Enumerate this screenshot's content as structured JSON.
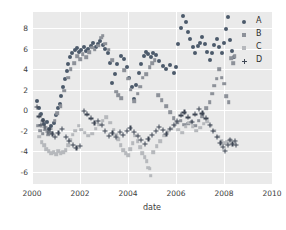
{
  "chart_data": {
    "type": "scatter",
    "title": "",
    "xlabel": "date",
    "ylabel": "",
    "xlim": [
      2000,
      2010
    ],
    "ylim": [
      -7.2,
      9.6
    ],
    "xticks": [
      2000,
      2002,
      2004,
      2006,
      2008,
      2010
    ],
    "yticks": [
      8,
      6,
      4,
      2,
      0,
      -2,
      -4,
      -6
    ],
    "grid": true,
    "legend_position": "upper right",
    "background": "#eaeaea",
    "gridline_color": "#ffffff",
    "series": [
      {
        "name": "A",
        "marker": "circle",
        "color": "#4c5a6b",
        "points": [
          [
            2000.22,
            0.9
          ],
          [
            2000.3,
            0.2
          ],
          [
            2000.38,
            -0.4
          ],
          [
            2000.45,
            -0.9
          ],
          [
            2000.52,
            -1.3
          ],
          [
            2000.62,
            -1.1
          ],
          [
            2000.72,
            -1.8
          ],
          [
            2000.8,
            -1.5
          ],
          [
            2000.9,
            -1.2
          ],
          [
            2001.0,
            -0.5
          ],
          [
            2001.08,
            0.2
          ],
          [
            2001.15,
            0.6
          ],
          [
            2001.22,
            1.4
          ],
          [
            2001.3,
            2.3
          ],
          [
            2001.38,
            3.1
          ],
          [
            2001.45,
            3.8
          ],
          [
            2001.52,
            4.5
          ],
          [
            2001.6,
            5.2
          ],
          [
            2001.68,
            5.6
          ],
          [
            2001.78,
            5.9
          ],
          [
            2001.88,
            6.1
          ],
          [
            2001.96,
            5.7
          ],
          [
            2002.05,
            5.9
          ],
          [
            2002.15,
            6.2
          ],
          [
            2002.25,
            5.8
          ],
          [
            2002.35,
            6.0
          ],
          [
            2002.45,
            6.3
          ],
          [
            2002.55,
            6.6
          ],
          [
            2002.65,
            6.2
          ],
          [
            2002.75,
            6.5
          ],
          [
            2002.85,
            6.8
          ],
          [
            2002.95,
            6.4
          ],
          [
            2003.05,
            6.0
          ],
          [
            2003.15,
            5.6
          ],
          [
            2003.25,
            4.6
          ],
          [
            2003.35,
            2.7
          ],
          [
            2003.45,
            3.5
          ],
          [
            2003.55,
            4.5
          ],
          [
            2003.7,
            5.3
          ],
          [
            2003.85,
            5.0
          ],
          [
            2003.95,
            4.2
          ],
          [
            2004.05,
            3.2
          ],
          [
            2004.15,
            2.3
          ],
          [
            2004.25,
            1.1
          ],
          [
            2004.35,
            2.5
          ],
          [
            2004.45,
            3.6
          ],
          [
            2004.55,
            4.5
          ],
          [
            2004.65,
            5.3
          ],
          [
            2004.75,
            5.7
          ],
          [
            2004.85,
            5.5
          ],
          [
            2004.95,
            5.2
          ],
          [
            2005.05,
            5.6
          ],
          [
            2005.15,
            5.4
          ],
          [
            2005.3,
            4.8
          ],
          [
            2005.45,
            4.3
          ],
          [
            2005.6,
            4.0
          ],
          [
            2005.75,
            4.4
          ],
          [
            2005.9,
            3.6
          ],
          [
            2006.0,
            4.2
          ],
          [
            2006.1,
            6.5
          ],
          [
            2006.2,
            8.0
          ],
          [
            2006.3,
            9.2
          ],
          [
            2006.4,
            8.6
          ],
          [
            2006.5,
            7.6
          ],
          [
            2006.6,
            7.0
          ],
          [
            2006.7,
            6.2
          ],
          [
            2006.8,
            5.6
          ],
          [
            2006.9,
            6.3
          ],
          [
            2007.0,
            6.6
          ],
          [
            2007.1,
            7.2
          ],
          [
            2007.2,
            6.5
          ],
          [
            2007.3,
            5.7
          ],
          [
            2007.4,
            4.9
          ],
          [
            2007.5,
            5.6
          ],
          [
            2007.6,
            6.4
          ],
          [
            2007.7,
            7.0
          ],
          [
            2007.8,
            6.2
          ],
          [
            2007.9,
            5.6
          ],
          [
            2008.0,
            6.6
          ],
          [
            2008.08,
            7.9
          ],
          [
            2008.16,
            9.1
          ],
          [
            2008.24,
            6.9
          ],
          [
            2008.32,
            5.8
          ],
          [
            2008.4,
            5.2
          ]
        ]
      },
      {
        "name": "B",
        "marker": "square",
        "color": "#8d9199",
        "points": [
          [
            2000.25,
            -1.5
          ],
          [
            2000.35,
            -2.0
          ],
          [
            2000.45,
            -2.3
          ],
          [
            2000.55,
            -1.9
          ],
          [
            2000.68,
            -2.4
          ],
          [
            2000.8,
            -2.2
          ],
          [
            2000.95,
            -1.0
          ],
          [
            2001.05,
            -0.3
          ],
          [
            2001.2,
            0.4
          ],
          [
            2001.35,
            1.9
          ],
          [
            2001.5,
            3.2
          ],
          [
            2001.62,
            4.0
          ],
          [
            2001.75,
            4.6
          ],
          [
            2001.88,
            5.3
          ],
          [
            2002.0,
            5.0
          ],
          [
            2002.12,
            5.5
          ],
          [
            2002.25,
            5.2
          ],
          [
            2002.38,
            5.7
          ],
          [
            2002.5,
            6.1
          ],
          [
            2002.62,
            5.9
          ],
          [
            2002.75,
            6.3
          ],
          [
            2002.88,
            7.1
          ],
          [
            2002.95,
            7.3
          ],
          [
            2003.05,
            6.5
          ],
          [
            2003.2,
            5.9
          ],
          [
            2003.35,
            4.9
          ],
          [
            2003.5,
            1.8
          ],
          [
            2003.6,
            1.5
          ],
          [
            2003.72,
            1.2
          ],
          [
            2003.85,
            3.9
          ],
          [
            2004.0,
            3.1
          ],
          [
            2004.12,
            2.0
          ],
          [
            2004.25,
            0.9
          ],
          [
            2004.4,
            1.6
          ],
          [
            2004.5,
            2.3
          ],
          [
            2004.62,
            3.2
          ],
          [
            2004.75,
            3.5
          ],
          [
            2004.9,
            4.2
          ],
          [
            2005.0,
            4.6
          ],
          [
            2005.12,
            4.9
          ],
          [
            2005.25,
            1.5
          ],
          [
            2005.4,
            1.0
          ],
          [
            2005.6,
            0.4
          ],
          [
            2005.75,
            -0.2
          ],
          [
            2005.9,
            -0.8
          ],
          [
            2006.05,
            -1.2
          ],
          [
            2006.2,
            -1.0
          ],
          [
            2006.35,
            -1.4
          ],
          [
            2006.5,
            -1.3
          ],
          [
            2006.65,
            -1.1
          ],
          [
            2006.8,
            -1.5
          ],
          [
            2006.95,
            -1.0
          ],
          [
            2007.1,
            -0.6
          ],
          [
            2007.25,
            0.2
          ],
          [
            2007.4,
            0.8
          ],
          [
            2007.5,
            1.6
          ],
          [
            2007.6,
            2.4
          ],
          [
            2007.7,
            3.1
          ],
          [
            2007.8,
            4.0
          ],
          [
            2007.9,
            3.2
          ],
          [
            2008.0,
            2.6
          ],
          [
            2008.1,
            1.4
          ],
          [
            2008.2,
            0.8
          ],
          [
            2008.3,
            5.1
          ],
          [
            2008.38,
            4.6
          ],
          [
            2008.45,
            5.3
          ]
        ]
      },
      {
        "name": "C",
        "marker": "square-light",
        "color": "#b6b8bc",
        "points": [
          [
            2000.3,
            -2.6
          ],
          [
            2000.4,
            -3.1
          ],
          [
            2000.5,
            -3.4
          ],
          [
            2000.6,
            -3.8
          ],
          [
            2000.7,
            -4.0
          ],
          [
            2000.8,
            -4.2
          ],
          [
            2000.9,
            -4.1
          ],
          [
            2001.0,
            -4.3
          ],
          [
            2001.1,
            -4.0
          ],
          [
            2001.2,
            -4.2
          ],
          [
            2001.3,
            -4.1
          ],
          [
            2001.4,
            -3.9
          ],
          [
            2001.5,
            -3.4
          ],
          [
            2001.6,
            -2.9
          ],
          [
            2001.7,
            -2.4
          ],
          [
            2001.8,
            -2.0
          ],
          [
            2001.95,
            -1.5
          ],
          [
            2002.05,
            -1.9
          ],
          [
            2002.2,
            -2.2
          ],
          [
            2002.35,
            -2.5
          ],
          [
            2002.5,
            -2.3
          ],
          [
            2002.65,
            -1.8
          ],
          [
            2002.8,
            -1.4
          ],
          [
            2002.95,
            -1.0
          ],
          [
            2003.1,
            -0.7
          ],
          [
            2003.25,
            -1.2
          ],
          [
            2003.4,
            -1.9
          ],
          [
            2003.5,
            -2.4
          ],
          [
            2003.6,
            -2.8
          ],
          [
            2003.7,
            -3.4
          ],
          [
            2003.8,
            -3.9
          ],
          [
            2003.9,
            -4.2
          ],
          [
            2004.0,
            -4.4
          ],
          [
            2004.1,
            -3.8
          ],
          [
            2004.2,
            -3.2
          ],
          [
            2004.3,
            -2.5
          ],
          [
            2004.4,
            -3.0
          ],
          [
            2004.5,
            -3.6
          ],
          [
            2004.6,
            -4.2
          ],
          [
            2004.7,
            -4.6
          ],
          [
            2004.78,
            -5.0
          ],
          [
            2004.85,
            -5.6
          ],
          [
            2004.9,
            -5.7
          ],
          [
            2004.95,
            -6.4
          ],
          [
            2005.05,
            -4.1
          ],
          [
            2005.2,
            -3.5
          ],
          [
            2005.35,
            -3.0
          ],
          [
            2005.5,
            -2.5
          ],
          [
            2005.65,
            -2.1
          ],
          [
            2005.8,
            -1.8
          ],
          [
            2005.95,
            -1.5
          ],
          [
            2006.1,
            -1.9
          ],
          [
            2006.25,
            -2.2
          ],
          [
            2006.4,
            -1.6
          ],
          [
            2006.55,
            -1.2
          ],
          [
            2006.7,
            -1.6
          ],
          [
            2006.85,
            -2.0
          ],
          [
            2007.0,
            -1.7
          ],
          [
            2007.15,
            -1.3
          ],
          [
            2007.3,
            -1.1
          ],
          [
            2007.45,
            -1.5
          ],
          [
            2007.6,
            -2.0
          ],
          [
            2007.75,
            -2.6
          ],
          [
            2007.9,
            -3.0
          ],
          [
            2008.0,
            -3.2
          ],
          [
            2008.12,
            -3.1
          ],
          [
            2008.25,
            -2.9
          ]
        ]
      },
      {
        "name": "D",
        "marker": "plus",
        "color": "#3f4754",
        "points": [
          [
            2000.2,
            0.3
          ],
          [
            2000.28,
            -0.6
          ],
          [
            2000.36,
            -1.4
          ],
          [
            2000.44,
            -1.0
          ],
          [
            2000.55,
            -1.6
          ],
          [
            2000.65,
            -2.1
          ],
          [
            2000.75,
            -1.8
          ],
          [
            2000.85,
            -2.3
          ],
          [
            2000.95,
            -2.6
          ],
          [
            2001.1,
            -2.2
          ],
          [
            2001.25,
            -1.8
          ],
          [
            2001.4,
            -2.6
          ],
          [
            2001.55,
            -3.0
          ],
          [
            2001.7,
            -3.4
          ],
          [
            2001.85,
            -3.7
          ],
          [
            2002.0,
            -3.5
          ],
          [
            2002.15,
            -0.1
          ],
          [
            2002.3,
            -0.4
          ],
          [
            2002.45,
            -0.8
          ],
          [
            2002.6,
            -1.2
          ],
          [
            2002.75,
            -1.0
          ],
          [
            2002.9,
            -1.4
          ],
          [
            2003.05,
            -2.0
          ],
          [
            2003.2,
            -2.5
          ],
          [
            2003.35,
            -2.2
          ],
          [
            2003.5,
            -2.6
          ],
          [
            2003.65,
            -2.1
          ],
          [
            2003.8,
            -2.4
          ],
          [
            2003.95,
            -2.0
          ],
          [
            2004.1,
            -1.7
          ],
          [
            2004.25,
            -2.1
          ],
          [
            2004.4,
            -2.5
          ],
          [
            2004.55,
            -2.9
          ],
          [
            2004.7,
            -3.3
          ],
          [
            2004.85,
            -2.8
          ],
          [
            2005.0,
            -2.4
          ],
          [
            2005.15,
            -2.0
          ],
          [
            2005.3,
            -1.6
          ],
          [
            2005.45,
            -1.9
          ],
          [
            2005.6,
            -2.3
          ],
          [
            2005.75,
            -1.8
          ],
          [
            2005.9,
            -1.4
          ],
          [
            2006.05,
            -1.0
          ],
          [
            2006.2,
            -0.5
          ],
          [
            2006.35,
            -0.2
          ],
          [
            2006.5,
            -0.7
          ],
          [
            2006.65,
            -1.1
          ],
          [
            2006.8,
            -0.4
          ],
          [
            2006.95,
            0.1
          ],
          [
            2007.1,
            -0.3
          ],
          [
            2007.25,
            -0.8
          ],
          [
            2007.4,
            -1.4
          ],
          [
            2007.55,
            -2.0
          ],
          [
            2007.7,
            -2.6
          ],
          [
            2007.85,
            -3.2
          ],
          [
            2007.95,
            -3.6
          ],
          [
            2008.05,
            -4.0
          ],
          [
            2008.15,
            -3.4
          ],
          [
            2008.25,
            -2.9
          ],
          [
            2008.35,
            -3.3
          ],
          [
            2008.45,
            -3.0
          ],
          [
            2008.5,
            -3.4
          ]
        ]
      }
    ]
  },
  "legend": {
    "entries": [
      {
        "label": "A",
        "marker": "circle",
        "color": "#4c5a6b"
      },
      {
        "label": "B",
        "marker": "square",
        "color": "#8d9199"
      },
      {
        "label": "C",
        "marker": "square-light",
        "color": "#b6b8bc"
      },
      {
        "label": "D",
        "marker": "plus",
        "color": "#3f4754"
      }
    ]
  },
  "axes": {
    "xlabel": "date",
    "xticks": [
      "2000",
      "2002",
      "2004",
      "2006",
      "2008",
      "2010"
    ],
    "yticks": [
      "8",
      "6",
      "4",
      "2",
      "0",
      "-2",
      "-4",
      "-6"
    ]
  }
}
